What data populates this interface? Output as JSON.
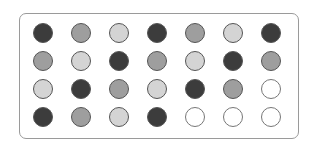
{
  "colors": {
    "dark": "#3c3c3c",
    "mid": "#9e9e9e",
    "light": "#d4d4d4",
    "empty": "#ffffff"
  },
  "grid": {
    "rows": 4,
    "cols": 7,
    "cells": [
      [
        "dark",
        "mid",
        "light",
        "dark",
        "mid",
        "light",
        "dark"
      ],
      [
        "mid",
        "light",
        "dark",
        "mid",
        "light",
        "dark",
        "mid"
      ],
      [
        "light",
        "dark",
        "mid",
        "light",
        "dark",
        "mid",
        "empty"
      ],
      [
        "dark",
        "mid",
        "light",
        "dark",
        "empty",
        "empty",
        "empty"
      ]
    ]
  }
}
